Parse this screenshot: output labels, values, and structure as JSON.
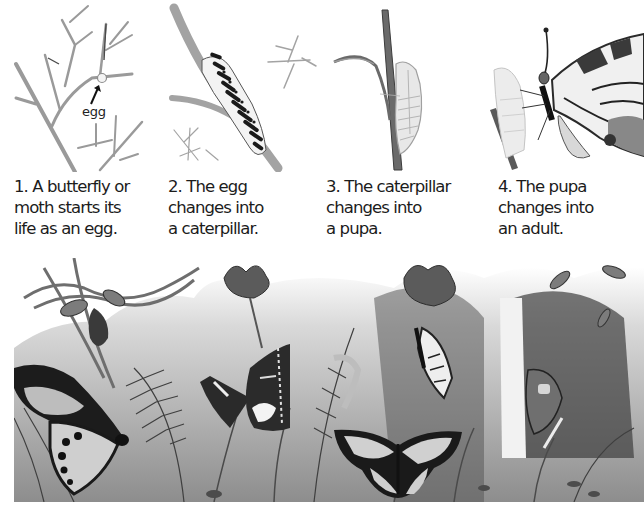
{
  "stages": [
    {
      "step": 1,
      "illustration": "egg-on-twig",
      "caption": "1. A butterfly or\nmoth starts its\nlife as an egg.",
      "annotation": "egg"
    },
    {
      "step": 2,
      "illustration": "caterpillar-on-stem",
      "caption": "2. The egg\nchanges into\na caterpillar."
    },
    {
      "step": 3,
      "illustration": "pupa-on-stem",
      "caption": "3. The caterpillar\nchanges into\na pupa."
    },
    {
      "step": 4,
      "illustration": "adult-emerging-from-pupa",
      "caption": "4. The pupa\nchanges into\nan adult."
    }
  ],
  "scene": {
    "illustration": "jungle-scene-with-butterflies",
    "palette": {
      "light": "#e6e6e6",
      "mid": "#8a8a8a",
      "dark": "#2a2a2a",
      "black": "#0e0e0e"
    }
  }
}
